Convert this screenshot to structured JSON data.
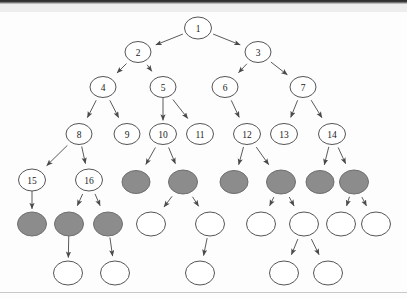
{
  "figure": {
    "type": "diagram",
    "subtype": "rooted-tree-graph",
    "background_color": "#fdfdfd",
    "top_bar_color": "#2b2b2b",
    "top_band_color": "#ededed",
    "bottom_rule_color": "#c9c9c9",
    "node_fill_white": "#ffffff",
    "node_fill_gray": "#8c8c8c",
    "node_stroke": "#555555",
    "edge_color": "#5a5a5a",
    "label_color": "#1a1a1a"
  },
  "tree": {
    "levels": 7,
    "numbered_node_count": 16,
    "unnumbered_node_count": 22,
    "nodes": [
      {
        "id": "n1",
        "label": "1",
        "cx": 198,
        "cy": 16,
        "rx": 13.5,
        "ry": 11.0,
        "fill": "white"
      },
      {
        "id": "n2",
        "label": "2",
        "cx": 138,
        "cy": 40,
        "rx": 13.0,
        "ry": 10.5,
        "fill": "white"
      },
      {
        "id": "n3",
        "label": "3",
        "cx": 258,
        "cy": 40,
        "rx": 13.0,
        "ry": 10.5,
        "fill": "white"
      },
      {
        "id": "n4",
        "label": "4",
        "cx": 103,
        "cy": 75,
        "rx": 13.0,
        "ry": 10.5,
        "fill": "white"
      },
      {
        "id": "n5",
        "label": "5",
        "cx": 163,
        "cy": 75,
        "rx": 13.0,
        "ry": 10.5,
        "fill": "white"
      },
      {
        "id": "n6",
        "label": "6",
        "cx": 225,
        "cy": 75,
        "rx": 13.0,
        "ry": 10.5,
        "fill": "white"
      },
      {
        "id": "n7",
        "label": "7",
        "cx": 303,
        "cy": 75,
        "rx": 13.0,
        "ry": 10.5,
        "fill": "white"
      },
      {
        "id": "n8",
        "label": "8",
        "cx": 79,
        "cy": 122,
        "rx": 13.0,
        "ry": 10.5,
        "fill": "white"
      },
      {
        "id": "n9",
        "label": "9",
        "cx": 127,
        "cy": 122,
        "rx": 13.0,
        "ry": 10.5,
        "fill": "white"
      },
      {
        "id": "n10",
        "label": "10",
        "cx": 163,
        "cy": 122,
        "rx": 13.5,
        "ry": 10.5,
        "fill": "white"
      },
      {
        "id": "n11",
        "label": "11",
        "cx": 200,
        "cy": 122,
        "rx": 13.5,
        "ry": 10.5,
        "fill": "white"
      },
      {
        "id": "n12",
        "label": "12",
        "cx": 247,
        "cy": 122,
        "rx": 13.5,
        "ry": 10.5,
        "fill": "white"
      },
      {
        "id": "n13",
        "label": "13",
        "cx": 284,
        "cy": 122,
        "rx": 13.5,
        "ry": 10.5,
        "fill": "white"
      },
      {
        "id": "n14",
        "label": "14",
        "cx": 332,
        "cy": 122,
        "rx": 13.5,
        "ry": 10.5,
        "fill": "white"
      },
      {
        "id": "n15",
        "label": "15",
        "cx": 32,
        "cy": 168,
        "rx": 13.5,
        "ry": 11.0,
        "fill": "white"
      },
      {
        "id": "n16",
        "label": "16",
        "cx": 89,
        "cy": 168,
        "rx": 13.5,
        "ry": 11.0,
        "fill": "white"
      },
      {
        "id": "g1",
        "label": "",
        "cx": 136,
        "cy": 170,
        "rx": 14.0,
        "ry": 11.5,
        "fill": "gray"
      },
      {
        "id": "g2",
        "label": "",
        "cx": 183,
        "cy": 170,
        "rx": 14.5,
        "ry": 12.0,
        "fill": "gray"
      },
      {
        "id": "g3",
        "label": "",
        "cx": 234,
        "cy": 170,
        "rx": 14.0,
        "ry": 11.5,
        "fill": "gray"
      },
      {
        "id": "g4",
        "label": "",
        "cx": 281,
        "cy": 170,
        "rx": 14.5,
        "ry": 12.0,
        "fill": "gray"
      },
      {
        "id": "g5",
        "label": "",
        "cx": 320,
        "cy": 170,
        "rx": 14.0,
        "ry": 11.5,
        "fill": "gray"
      },
      {
        "id": "g6",
        "label": "",
        "cx": 354,
        "cy": 170,
        "rx": 14.5,
        "ry": 12.0,
        "fill": "gray"
      },
      {
        "id": "g7",
        "label": "",
        "cx": 32,
        "cy": 212,
        "rx": 14.5,
        "ry": 12.0,
        "fill": "gray"
      },
      {
        "id": "g8",
        "label": "",
        "cx": 69,
        "cy": 212,
        "rx": 14.5,
        "ry": 12.0,
        "fill": "gray"
      },
      {
        "id": "g9",
        "label": "",
        "cx": 108,
        "cy": 212,
        "rx": 14.5,
        "ry": 12.0,
        "fill": "gray"
      },
      {
        "id": "w1",
        "label": "",
        "cx": 151,
        "cy": 212,
        "rx": 14.5,
        "ry": 12.0,
        "fill": "white"
      },
      {
        "id": "w2",
        "label": "",
        "cx": 210,
        "cy": 212,
        "rx": 14.5,
        "ry": 12.0,
        "fill": "white"
      },
      {
        "id": "w3",
        "label": "",
        "cx": 261,
        "cy": 212,
        "rx": 14.5,
        "ry": 12.0,
        "fill": "white"
      },
      {
        "id": "w4",
        "label": "",
        "cx": 304,
        "cy": 212,
        "rx": 14.5,
        "ry": 12.0,
        "fill": "white"
      },
      {
        "id": "w5",
        "label": "",
        "cx": 341,
        "cy": 212,
        "rx": 14.5,
        "ry": 12.0,
        "fill": "white"
      },
      {
        "id": "w6",
        "label": "",
        "cx": 376,
        "cy": 212,
        "rx": 14.5,
        "ry": 12.0,
        "fill": "white"
      },
      {
        "id": "w7",
        "label": "",
        "cx": 68,
        "cy": 261,
        "rx": 14.5,
        "ry": 12.0,
        "fill": "white"
      },
      {
        "id": "w8",
        "label": "",
        "cx": 115,
        "cy": 261,
        "rx": 14.5,
        "ry": 12.0,
        "fill": "white"
      },
      {
        "id": "w9",
        "label": "",
        "cx": 200,
        "cy": 261,
        "rx": 14.5,
        "ry": 12.0,
        "fill": "white"
      },
      {
        "id": "w10",
        "label": "",
        "cx": 284,
        "cy": 261,
        "rx": 14.5,
        "ry": 12.0,
        "fill": "white"
      },
      {
        "id": "w11",
        "label": "",
        "cx": 328,
        "cy": 261,
        "rx": 14.5,
        "ry": 12.0,
        "fill": "white"
      }
    ],
    "edges": [
      {
        "from": "n1",
        "to": "n2"
      },
      {
        "from": "n1",
        "to": "n3"
      },
      {
        "from": "n2",
        "to": "n4"
      },
      {
        "from": "n2",
        "to": "n5"
      },
      {
        "from": "n3",
        "to": "n6"
      },
      {
        "from": "n3",
        "to": "n7"
      },
      {
        "from": "n4",
        "to": "n8"
      },
      {
        "from": "n4",
        "to": "n9"
      },
      {
        "from": "n5",
        "to": "n10"
      },
      {
        "from": "n5",
        "to": "n11"
      },
      {
        "from": "n6",
        "to": "n12"
      },
      {
        "from": "n7",
        "to": "n13"
      },
      {
        "from": "n7",
        "to": "n14"
      },
      {
        "from": "n8",
        "to": "n15"
      },
      {
        "from": "n8",
        "to": "n16"
      },
      {
        "from": "n10",
        "to": "g1"
      },
      {
        "from": "n10",
        "to": "g2"
      },
      {
        "from": "n12",
        "to": "g3"
      },
      {
        "from": "n12",
        "to": "g4"
      },
      {
        "from": "n14",
        "to": "g5"
      },
      {
        "from": "n14",
        "to": "g6"
      },
      {
        "from": "n15",
        "to": "g7"
      },
      {
        "from": "n16",
        "to": "g8"
      },
      {
        "from": "n16",
        "to": "g9"
      },
      {
        "from": "g2",
        "to": "w1"
      },
      {
        "from": "g2",
        "to": "w2"
      },
      {
        "from": "g4",
        "to": "w3"
      },
      {
        "from": "g4",
        "to": "w4"
      },
      {
        "from": "g6",
        "to": "w5"
      },
      {
        "from": "g6",
        "to": "w6"
      },
      {
        "from": "g8",
        "to": "w7"
      },
      {
        "from": "g9",
        "to": "w8"
      },
      {
        "from": "w2",
        "to": "w9"
      },
      {
        "from": "w4",
        "to": "w10"
      },
      {
        "from": "w4",
        "to": "w11"
      }
    ]
  }
}
